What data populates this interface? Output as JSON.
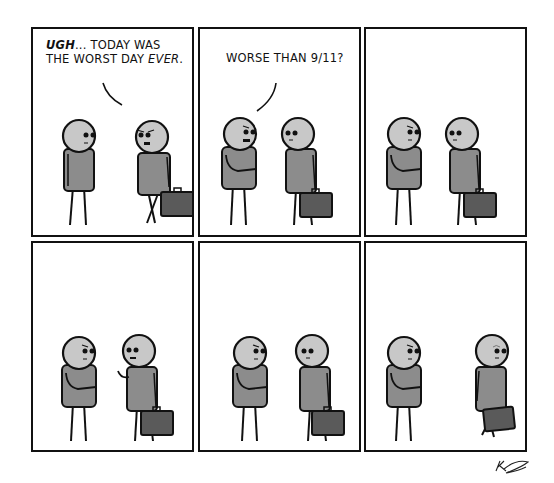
{
  "comic": {
    "layout": {
      "rows": 2,
      "cols": 3,
      "background": "#ffffff",
      "border_color": "#111111"
    },
    "colors": {
      "head": "#c8c8c8",
      "body": "#8c8c8c",
      "briefcase": "#5a5a5a",
      "outline": "#111111"
    },
    "panels": [
      {
        "index": 1,
        "dialogue": {
          "speaker": "right-character",
          "part1_emphasis": "UGH",
          "part2": "... TODAY WAS",
          "part3": "THE WORST DAY ",
          "part4_emphasis": "EVER",
          "part5": "."
        }
      },
      {
        "index": 2,
        "dialogue": {
          "speaker": "left-character",
          "text": "WORSE THAN 9/11?"
        }
      },
      {
        "index": 3,
        "dialogue": null
      },
      {
        "index": 4,
        "dialogue": null
      },
      {
        "index": 5,
        "dialogue": null
      },
      {
        "index": 6,
        "dialogue": null
      }
    ],
    "signature": "artist-signature"
  }
}
